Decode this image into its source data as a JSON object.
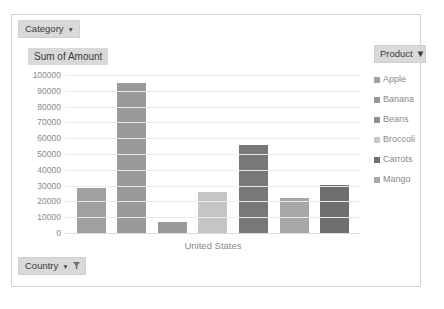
{
  "chart_frame": {
    "name": "pivot-chart"
  },
  "fields": {
    "category": {
      "label": "Category",
      "caret": "▼"
    },
    "country": {
      "label": "Country",
      "caret": "▼",
      "filter_icon": "funnel-icon"
    }
  },
  "value_title": "Sum of Amount",
  "legend": {
    "field_label": "Product",
    "caret": "▼",
    "items": [
      {
        "label": "Apple",
        "color": "#a0a0a0"
      },
      {
        "label": "Banana",
        "color": "#969696"
      },
      {
        "label": "Beans",
        "color": "#8f8f8f"
      },
      {
        "label": "Broccoli",
        "color": "#c8c8c8"
      },
      {
        "label": "Carrots",
        "color": "#6e6e6e"
      },
      {
        "label": "Mango",
        "color": "#a8a8a8"
      }
    ]
  },
  "chart_data": {
    "type": "bar",
    "title": "Sum of Amount",
    "xlabel": "United States",
    "ylabel": "",
    "categories": [
      "Apple",
      "Banana",
      "Beans",
      "Broccoli",
      "Carrots",
      "Mango",
      "Carrots"
    ],
    "series": [
      {
        "name": "Sum of Amount",
        "values": [
          28500,
          95000,
          7000,
          26000,
          56000,
          22000,
          30500
        ]
      }
    ],
    "bar_colors": [
      "#a0a0a0",
      "#9a9a9a",
      "#999999",
      "#c5c5c5",
      "#787878",
      "#a8a8a8",
      "#6e6e6e"
    ],
    "ylim": [
      0,
      100000
    ],
    "ytick_step": 10000,
    "yticks": [
      "100000",
      "90000",
      "80000",
      "70000",
      "60000",
      "50000",
      "40000",
      "30000",
      "20000",
      "10000",
      "0"
    ],
    "grid": true,
    "legend_position": "right",
    "x_tick_labels": [
      "United States"
    ]
  }
}
